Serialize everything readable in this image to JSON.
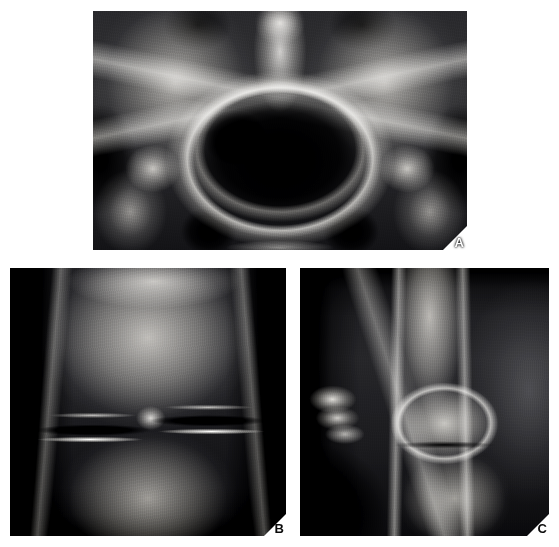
{
  "figure": {
    "type": "radiograph-plate",
    "background_color": "#ffffff",
    "width": 559,
    "height": 547,
    "panel_count": 3,
    "layout": "one-wide-top-two-below"
  },
  "panels": [
    {
      "id": "A",
      "label": "A",
      "label_color": "#ffffff",
      "label_position": "bottom-right",
      "modality": "radiograph",
      "view": "AP pelvis",
      "anatomy": "pelvis",
      "description": "Anteroposterior radiograph of the pelvis showing both iliac wings, sacrum, sacroiliac joints, pelvic brim, acetabula, femoral heads and proximal femora.",
      "dominant_tone": "#2e2e31",
      "rect": {
        "x": 93,
        "y": 11,
        "w": 374,
        "h": 239
      }
    },
    {
      "id": "B",
      "label": "B",
      "label_color": "#ffffff",
      "label_position": "bottom-right",
      "modality": "radiograph",
      "view": "AP knee",
      "anatomy": "knee",
      "description": "Anteroposterior radiograph of the knee showing distal femoral condyles, intercondylar eminence, joint space and proximal tibia with dense subchondral plateau lines.",
      "dominant_tone": "#2a2a2d",
      "rect": {
        "x": 10,
        "y": 268,
        "w": 276,
        "h": 268
      }
    },
    {
      "id": "C",
      "label": "C",
      "label_color": "#111111",
      "label_position": "bottom-right",
      "modality": "radiograph",
      "view": "lateral knee",
      "anatomy": "knee",
      "description": "Lateral radiograph of the knee showing the femoral shaft, superimposed femoral condyles, patella anteriorly and the proximal tibia.",
      "dominant_tone": "#26262a",
      "rect": {
        "x": 300,
        "y": 268,
        "w": 249,
        "h": 268
      }
    }
  ]
}
